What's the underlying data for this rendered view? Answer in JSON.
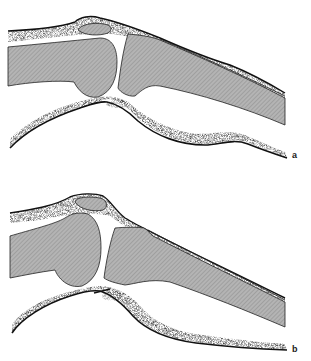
{
  "figure": {
    "panels": [
      {
        "id": "a",
        "label": "a"
      },
      {
        "id": "b",
        "label": "b"
      }
    ],
    "structures": [
      "skin-outline",
      "patella",
      "femur",
      "tibia",
      "soft-tissue-stipple"
    ],
    "colors": {
      "bone_fill": "#a9a9a9",
      "outline": "#111111",
      "background": "#ffffff",
      "stipple": "#555555"
    },
    "caption": ""
  }
}
